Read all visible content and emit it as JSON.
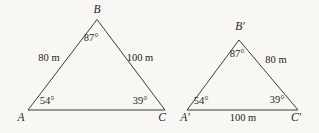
{
  "figure": {
    "background": "#f8f7f4",
    "stroke_color": "#3b3b3b",
    "triangles": [
      {
        "id": "ABC",
        "points": "28,110 97,19.5 165,110",
        "vertex_a": "A",
        "vertex_b": "B",
        "vertex_c": "C",
        "angle_a": "54°",
        "angle_b": "87°",
        "angle_c": "39°",
        "side_ab": "80 m",
        "side_bc": "100 m"
      },
      {
        "id": "A'B'C'",
        "points": "187,110 239,40 298,110",
        "vertex_a": "A′",
        "vertex_b": "B′",
        "vertex_c": "C′",
        "angle_a": "54°",
        "angle_b": "87°",
        "angle_c": "39°",
        "side_bc": "80 m",
        "side_ac": "100 m"
      }
    ]
  }
}
